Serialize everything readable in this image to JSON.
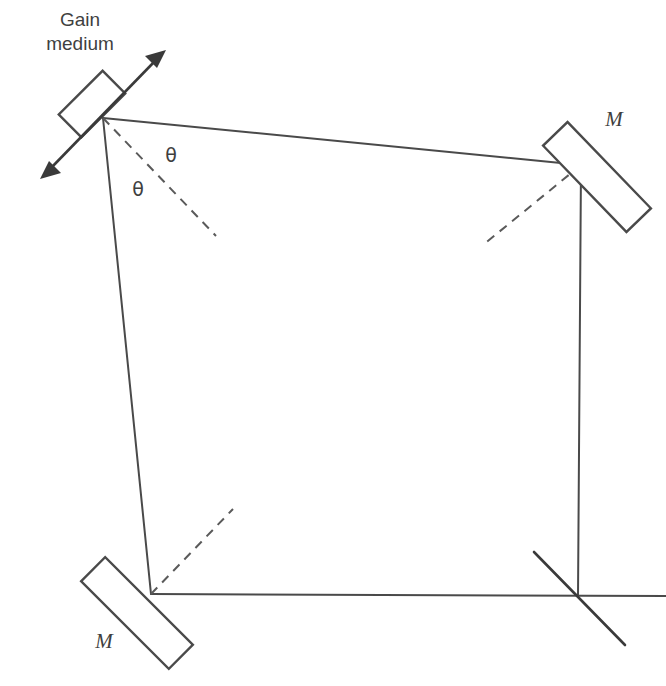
{
  "figure": {
    "kind": "optical-ring-cavity-diagram",
    "background_color": "#ffffff",
    "line_color": "#4a4a4a",
    "text_color": "#3f3f3f",
    "width": 666,
    "height": 686
  },
  "labels": {
    "gain_medium_line1": "Gain",
    "gain_medium_line2": "medium",
    "mirror_top_right": "M",
    "mirror_bottom_left": "M",
    "angle_upper": "θ",
    "angle_lower": "θ"
  },
  "components": {
    "gain_medium": {
      "name": "gain-medium",
      "center_x": 92,
      "center_y": 104,
      "tilt_deg": 45,
      "length": 60,
      "thickness": 32
    },
    "mirror_top_right": {
      "name": "mirror-top-right",
      "center_x": 597,
      "center_y": 177,
      "tilt_deg": 46,
      "length": 120,
      "thickness": 34
    },
    "mirror_bottom_left": {
      "name": "mirror-bottom-left",
      "center_x": 137,
      "center_y": 613,
      "tilt_deg": 45,
      "length": 124,
      "thickness": 34
    },
    "output_coupler": {
      "name": "output-coupler",
      "x1": 534,
      "y1": 552,
      "x2": 625,
      "y2": 645
    }
  },
  "cavity_path": {
    "vertices": [
      {
        "name": "gain-medium-vertex",
        "x": 103,
        "y": 118
      },
      {
        "name": "top-right-mirror-vertex",
        "x": 581,
        "y": 165
      },
      {
        "name": "bottom-right-crossing",
        "x": 578,
        "y": 596
      },
      {
        "name": "bottom-left-mirror-vertex",
        "x": 151,
        "y": 594
      }
    ],
    "bottom_beam_extension_x": 666,
    "right_beam_top_y": 165
  },
  "normals": [
    {
      "name": "normal-gain-medium",
      "x1": 103,
      "y1": 118,
      "x2": 216,
      "y2": 236
    },
    {
      "name": "normal-top-right-mirror",
      "x1": 581,
      "y1": 165,
      "x2": 483,
      "y2": 245
    },
    {
      "name": "normal-bottom-left-mirror",
      "x1": 151,
      "y1": 594,
      "x2": 233,
      "y2": 509
    }
  ],
  "pump_arrow": {
    "name": "pump-beam-double-arrow",
    "x1": 40,
    "y1": 179,
    "x2": 166,
    "y2": 50
  },
  "text_positions": {
    "gain_line1": {
      "x": 80,
      "y": 26
    },
    "gain_line2": {
      "x": 80,
      "y": 50
    },
    "mirror_tr": {
      "x": 614,
      "y": 126
    },
    "mirror_bl": {
      "x": 104,
      "y": 648
    },
    "theta_upper": {
      "x": 171,
      "y": 162
    },
    "theta_lower": {
      "x": 138,
      "y": 196
    }
  }
}
